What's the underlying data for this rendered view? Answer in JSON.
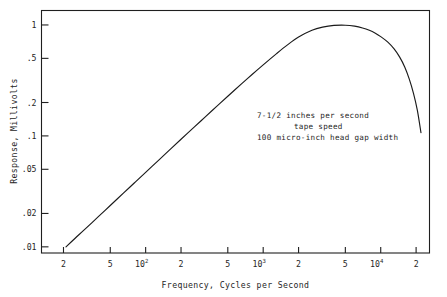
{
  "chart_data": {
    "type": "line",
    "title": "",
    "xlabel": "Frequency, Cycles per Second",
    "ylabel": "Response, Millivolts",
    "xscale": "log",
    "yscale": "log",
    "xlim": [
      13,
      26000
    ],
    "ylim": [
      0.0088,
      1.35
    ],
    "grid": false,
    "legend": null,
    "annotations": [
      "7-1/2 inches per second",
      "tape speed",
      "100 micro-inch head gap width"
    ],
    "xticks": [
      {
        "value": 20,
        "label": "2"
      },
      {
        "value": 50,
        "label": "5"
      },
      {
        "value": 100,
        "label": "10",
        "sup": "2"
      },
      {
        "value": 200,
        "label": "2"
      },
      {
        "value": 500,
        "label": "5"
      },
      {
        "value": 1000,
        "label": "10",
        "sup": "3"
      },
      {
        "value": 2000,
        "label": "2"
      },
      {
        "value": 5000,
        "label": "5"
      },
      {
        "value": 10000,
        "label": "10",
        "sup": "4"
      },
      {
        "value": 20000,
        "label": "2"
      }
    ],
    "yticks": [
      {
        "value": 1,
        "label": "1"
      },
      {
        "value": 0.5,
        "label": ".5"
      },
      {
        "value": 0.2,
        "label": ".2"
      },
      {
        "value": 0.1,
        "label": ".1"
      },
      {
        "value": 0.05,
        "label": ".05"
      },
      {
        "value": 0.02,
        "label": ".02"
      },
      {
        "value": 0.01,
        "label": ".01"
      }
    ],
    "series": [
      {
        "name": "Tape head response",
        "x": [
          21,
          25,
          30,
          40,
          50,
          65,
          80,
          100,
          130,
          160,
          200,
          260,
          320,
          400,
          500,
          650,
          800,
          1000,
          1300,
          1600,
          2000,
          2600,
          3200,
          4000,
          5000,
          6000,
          7000,
          8000,
          9000,
          10000,
          11500,
          13000,
          14500,
          16000,
          17500,
          19000,
          20500,
          22000
        ],
        "y": [
          0.01,
          0.0119,
          0.0142,
          0.0189,
          0.0236,
          0.0306,
          0.0376,
          0.0469,
          0.0608,
          0.0747,
          0.0932,
          0.1206,
          0.1477,
          0.1836,
          0.2278,
          0.2927,
          0.356,
          0.437,
          0.552,
          0.658,
          0.778,
          0.895,
          0.955,
          0.99,
          0.995,
          0.975,
          0.94,
          0.895,
          0.842,
          0.785,
          0.7,
          0.608,
          0.513,
          0.418,
          0.325,
          0.242,
          0.17,
          0.107
        ]
      }
    ]
  },
  "axis": {
    "x_title": "Frequency, Cycles per Second",
    "y_title": "Response, Millivolts"
  },
  "annotation": {
    "line1": "7-1/2 inches per second",
    "line2": "tape speed",
    "line3": "100 micro-inch head gap width"
  },
  "colors": {
    "curve": "#1a1a1a",
    "frame": "#1f1f1f",
    "text": "#262626",
    "background": "#ffffff"
  }
}
